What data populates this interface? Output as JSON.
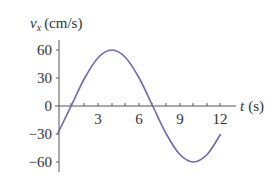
{
  "chart_data": {
    "type": "line",
    "title": "",
    "xlabel": "t (s)",
    "ylabel": "v_x (cm/s)",
    "xlim": [
      0,
      12
    ],
    "ylim": [
      -60,
      60
    ],
    "x_ticks": [
      3,
      6,
      9,
      12
    ],
    "y_ticks": [
      60,
      30,
      0,
      -30,
      -60
    ],
    "series": [
      {
        "name": "v_x",
        "color": "#6b6bb3",
        "x": [
          0,
          1,
          2,
          3,
          4,
          5,
          6,
          7,
          8,
          9,
          10,
          11,
          12
        ],
        "values": [
          -30,
          0,
          30,
          52,
          60,
          52,
          30,
          0,
          -30,
          -52,
          -60,
          -52,
          -30
        ]
      }
    ],
    "grid": false,
    "legend": null
  },
  "labels": {
    "y_axis_var": "v",
    "y_axis_sub": "x",
    "y_axis_unit": "(cm/s)",
    "x_axis_var": "t",
    "x_axis_unit": "(s)",
    "y_tick_60": "60",
    "y_tick_30": "30",
    "y_tick_0": "0",
    "y_tick_m30": "−30",
    "y_tick_m60": "−60",
    "x_tick_3": "3",
    "x_tick_6": "6",
    "x_tick_9": "9",
    "x_tick_12": "12"
  }
}
